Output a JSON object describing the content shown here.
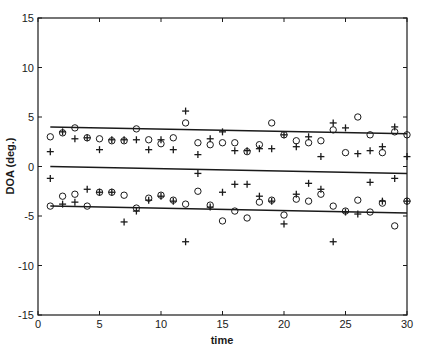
{
  "chart_data": {
    "type": "scatter",
    "title": "",
    "xlabel": "time",
    "ylabel": "DOA (deg.)",
    "xlim": [
      0,
      30
    ],
    "ylim": [
      -15,
      15
    ],
    "xticks": [
      0,
      5,
      10,
      15,
      20,
      25,
      30
    ],
    "yticks": [
      -15,
      -10,
      -5,
      0,
      5,
      10,
      15
    ],
    "grid": false,
    "legend": null,
    "lines": [
      {
        "name": "upper-track",
        "x": [
          1,
          30
        ],
        "y": [
          4.0,
          3.3
        ]
      },
      {
        "name": "middle-track",
        "x": [
          1,
          30
        ],
        "y": [
          0.0,
          -0.7
        ]
      },
      {
        "name": "lower-track",
        "x": [
          1,
          30
        ],
        "y": [
          -4.0,
          -4.7
        ]
      }
    ],
    "series": [
      {
        "name": "circle-estimates",
        "marker": "o",
        "points": [
          [
            1,
            3.0
          ],
          [
            2,
            3.4
          ],
          [
            3,
            3.9
          ],
          [
            4,
            2.9
          ],
          [
            5,
            2.8
          ],
          [
            6,
            2.6
          ],
          [
            7,
            2.6
          ],
          [
            8,
            3.8
          ],
          [
            9,
            2.7
          ],
          [
            10,
            2.3
          ],
          [
            11,
            2.9
          ],
          [
            12,
            4.4
          ],
          [
            13,
            2.4
          ],
          [
            14,
            2.2
          ],
          [
            15,
            2.4
          ],
          [
            16,
            2.4
          ],
          [
            17,
            1.5
          ],
          [
            18,
            2.2
          ],
          [
            19,
            4.4
          ],
          [
            20,
            3.2
          ],
          [
            21,
            2.6
          ],
          [
            22,
            2.4
          ],
          [
            23,
            2.6
          ],
          [
            24,
            3.7
          ],
          [
            25,
            1.4
          ],
          [
            26,
            5.0
          ],
          [
            27,
            3.2
          ],
          [
            28,
            1.4
          ],
          [
            29,
            3.5
          ],
          [
            30,
            3.2
          ],
          [
            1,
            -4.0
          ],
          [
            2,
            -3.0
          ],
          [
            3,
            -2.8
          ],
          [
            4,
            -4.0
          ],
          [
            5,
            -2.6
          ],
          [
            6,
            -2.6
          ],
          [
            7,
            -2.9
          ],
          [
            8,
            -4.2
          ],
          [
            9,
            -3.2
          ],
          [
            10,
            -2.9
          ],
          [
            11,
            -3.4
          ],
          [
            12,
            -3.8
          ],
          [
            13,
            -2.5
          ],
          [
            14,
            -3.9
          ],
          [
            15,
            -5.5
          ],
          [
            16,
            -4.5
          ],
          [
            17,
            -5.2
          ],
          [
            18,
            -3.6
          ],
          [
            19,
            -3.4
          ],
          [
            20,
            -4.9
          ],
          [
            21,
            -3.3
          ],
          [
            22,
            -3.5
          ],
          [
            23,
            -2.8
          ],
          [
            24,
            -4.0
          ],
          [
            25,
            -4.5
          ],
          [
            26,
            -3.4
          ],
          [
            27,
            -4.6
          ],
          [
            28,
            -3.7
          ],
          [
            29,
            -6.0
          ],
          [
            30,
            -3.5
          ]
        ]
      },
      {
        "name": "plus-estimates",
        "marker": "+",
        "points": [
          [
            1,
            1.5
          ],
          [
            2,
            3.5
          ],
          [
            3,
            2.8
          ],
          [
            4,
            2.9
          ],
          [
            5,
            1.7
          ],
          [
            6,
            2.7
          ],
          [
            7,
            2.7
          ],
          [
            8,
            2.7
          ],
          [
            9,
            1.7
          ],
          [
            10,
            2.7
          ],
          [
            11,
            1.7
          ],
          [
            12,
            5.6
          ],
          [
            13,
            1.2
          ],
          [
            14,
            2.8
          ],
          [
            15,
            3.5
          ],
          [
            16,
            1.6
          ],
          [
            17,
            1.6
          ],
          [
            18,
            1.8
          ],
          [
            19,
            1.8
          ],
          [
            20,
            3.2
          ],
          [
            21,
            2.0
          ],
          [
            22,
            3.0
          ],
          [
            23,
            1.0
          ],
          [
            24,
            4.4
          ],
          [
            25,
            3.9
          ],
          [
            26,
            1.3
          ],
          [
            27,
            1.6
          ],
          [
            28,
            2.0
          ],
          [
            29,
            4.0
          ],
          [
            30,
            1.0
          ],
          [
            1,
            -1.2
          ],
          [
            2,
            -3.8
          ],
          [
            3,
            -3.6
          ],
          [
            4,
            -2.3
          ],
          [
            5,
            -2.6
          ],
          [
            6,
            -2.6
          ],
          [
            7,
            -5.6
          ],
          [
            8,
            -4.5
          ],
          [
            9,
            -3.4
          ],
          [
            10,
            -3.0
          ],
          [
            11,
            -3.5
          ],
          [
            12,
            -7.6
          ],
          [
            13,
            -0.7
          ],
          [
            14,
            -4.1
          ],
          [
            15,
            -2.6
          ],
          [
            16,
            -1.8
          ],
          [
            17,
            -1.8
          ],
          [
            18,
            -3.0
          ],
          [
            19,
            -3.5
          ],
          [
            20,
            -5.8
          ],
          [
            21,
            -2.8
          ],
          [
            22,
            -1.7
          ],
          [
            23,
            -2.3
          ],
          [
            24,
            -7.6
          ],
          [
            25,
            -4.6
          ],
          [
            26,
            -4.8
          ],
          [
            27,
            -1.6
          ],
          [
            28,
            -3.5
          ],
          [
            29,
            -1.2
          ],
          [
            30,
            -3.5
          ]
        ]
      }
    ]
  }
}
